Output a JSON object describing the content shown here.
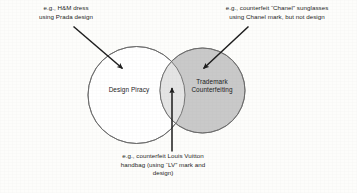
{
  "diagram": {
    "type": "venn",
    "background_color": "#fdfdfb",
    "sets": [
      {
        "id": "design-piracy",
        "label": "Design Piracy",
        "fill_color": "#ffffff",
        "stroke_color": "#6b6b6b"
      },
      {
        "id": "trademark-counterfeiting",
        "label": "Trademark\nCounterfeiting",
        "fill_color": "#c9c9c9",
        "stroke_color": "#6b6b6b"
      }
    ],
    "intersection": {
      "id": "overlap-region",
      "fill_color": "#e4e4e4",
      "label": ""
    },
    "callouts": [
      {
        "id": "callout-design-piracy",
        "text": "e.g., H&M dress\nusing Prada design",
        "points_to": "design-piracy",
        "arrow_color": "#1d1d1d"
      },
      {
        "id": "callout-trademark-counterfeiting",
        "text": "e.g., counterfeit “Chanel” sunglasses\nusing Chanel mark, but not design",
        "points_to": "trademark-counterfeiting",
        "arrow_color": "#1d1d1d"
      },
      {
        "id": "callout-overlap",
        "text": "e.g., counterfeit Louis Vuitton\nhandbag (using “LV” mark and\ndesign)",
        "points_to": "overlap-region",
        "arrow_color": "#1d1d1d"
      }
    ]
  }
}
